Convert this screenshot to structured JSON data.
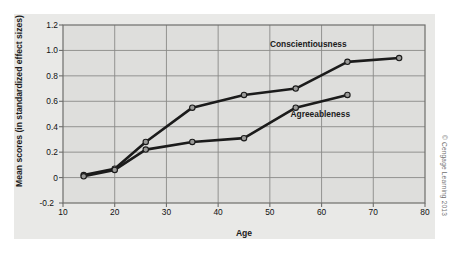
{
  "chart_data": {
    "type": "line",
    "title": "",
    "xlabel": "Age",
    "ylabel": "Mean scores (in standardized effect sizes)",
    "xlim": [
      10,
      80
    ],
    "ylim": [
      -0.2,
      1.2
    ],
    "xticks": [
      "10",
      "20",
      "30",
      "40",
      "50",
      "60",
      "70",
      "80"
    ],
    "yticks": [
      "1.2",
      "1.0",
      "0.8",
      "0.6",
      "0.4",
      "0.2",
      "0",
      "-0.2"
    ],
    "xtick_values": [
      10,
      20,
      30,
      40,
      50,
      60,
      70,
      80
    ],
    "ytick_values": [
      1.2,
      1.0,
      0.8,
      0.6,
      0.4,
      0.2,
      0,
      -0.2
    ],
    "grid": true,
    "legend_position": "inline-annotations",
    "series": [
      {
        "name": "Conscientiousness",
        "x": [
          14,
          20,
          26,
          35,
          45,
          55,
          65,
          75
        ],
        "values": [
          0.02,
          0.07,
          0.28,
          0.55,
          0.65,
          0.7,
          0.91,
          0.94
        ],
        "color": "#1b1b1b",
        "marker": "circle",
        "label_x": 50,
        "label_y": 1.05
      },
      {
        "name": "Agreeableness",
        "x": [
          14,
          20,
          26,
          35,
          45,
          55,
          65
        ],
        "values": [
          0.01,
          0.06,
          0.22,
          0.28,
          0.31,
          0.55,
          0.65
        ],
        "color": "#1b1b1b",
        "marker": "circle",
        "label_x": 54,
        "label_y": 0.5
      }
    ]
  },
  "figure": {
    "background_color": "#e9e9e7",
    "plot_background_color": "#dededc",
    "grid_color": "#8a8a88",
    "axis_color": "#6e6e6c",
    "line_color": "#1b1b1b",
    "marker_fill": "#9a9a98"
  },
  "copyright": "© Cengage Learning 2013"
}
